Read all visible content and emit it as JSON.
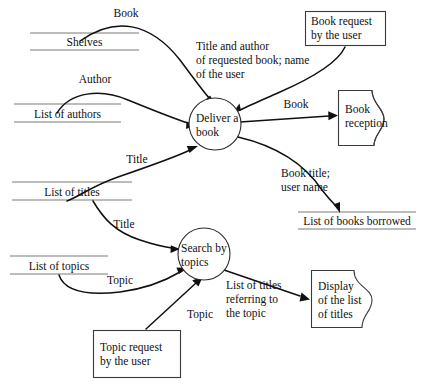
{
  "diagram": {
    "type": "data-flow-diagram",
    "colors": {
      "background": "#ffffff",
      "stroke": "#101010",
      "store_line": "#7a7a7a",
      "box_stroke": "#3a3a3a"
    }
  },
  "processes": [
    {
      "id": "deliver-a-book",
      "line1": "Deliver a",
      "line2": "book"
    },
    {
      "id": "search-by-topics",
      "line1": "Search by",
      "line2": "topics"
    }
  ],
  "data_stores": [
    {
      "id": "shelves",
      "label": "Shelves"
    },
    {
      "id": "list-of-authors",
      "label": "List of authors"
    },
    {
      "id": "list-of-titles",
      "label": "List of titles"
    },
    {
      "id": "list-of-topics",
      "label": "List of topics"
    },
    {
      "id": "list-of-books-borrowed",
      "label": "List of books borrowed"
    }
  ],
  "external_entities": [
    {
      "id": "book-request",
      "line1": "Book request",
      "line2": "by the user"
    },
    {
      "id": "topic-request",
      "line1": "Topic request",
      "line2": "by the user"
    }
  ],
  "output_documents": [
    {
      "id": "book-reception",
      "line1": "Book",
      "line2": "reception",
      "line3": ""
    },
    {
      "id": "display-of-list-of-titles",
      "line1": "Display",
      "line2": "of the list",
      "line3": "of titles"
    }
  ],
  "flows": [
    {
      "id": "flow-book-from-shelves",
      "label": "Book"
    },
    {
      "id": "flow-author",
      "label": "Author"
    },
    {
      "id": "flow-title-to-deliver",
      "label": "Title"
    },
    {
      "id": "flow-request-details",
      "line1": "Title and author",
      "line2": "of requested book; name",
      "line3": "of the user"
    },
    {
      "id": "flow-book-to-reception",
      "label": "Book"
    },
    {
      "id": "flow-borrow-record",
      "line1": "Book title;",
      "line2": "user name"
    },
    {
      "id": "flow-title-to-search",
      "label": "Title"
    },
    {
      "id": "flow-topic-from-store",
      "label": "Topic"
    },
    {
      "id": "flow-topic-from-user",
      "label": "Topic"
    },
    {
      "id": "flow-result-titles",
      "line1": "List of titles",
      "line2": "referring to",
      "line3": "the topic"
    }
  ]
}
